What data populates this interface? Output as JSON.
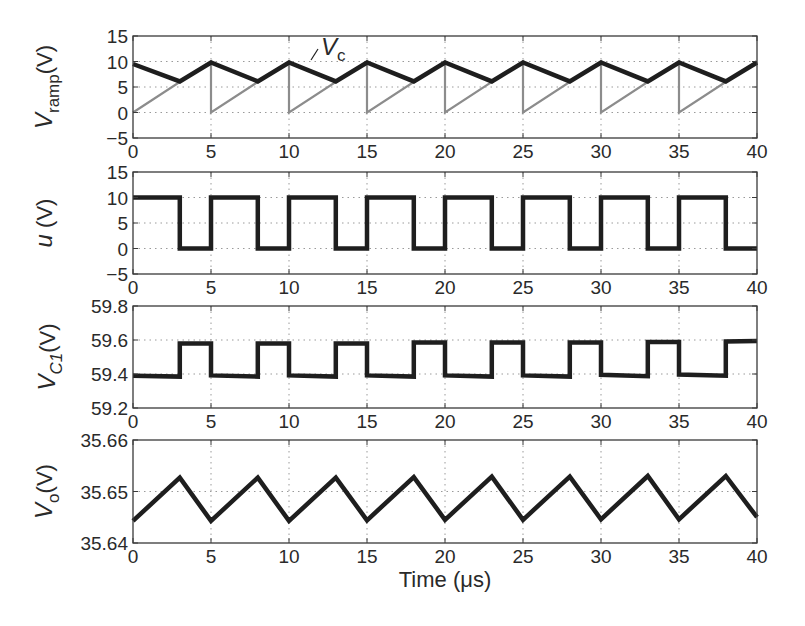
{
  "figure": {
    "xlabel": "Time (μs)",
    "x_ticks": [
      "0",
      "5",
      "10",
      "15",
      "20",
      "25",
      "30",
      "35",
      "40"
    ]
  },
  "colors": {
    "axis": "#3a3a3a",
    "grid": "#9a9a9a",
    "trace_dark": "#1e1e1e",
    "trace_light": "#8c8c8c"
  },
  "chart_data": [
    {
      "type": "line",
      "title": "",
      "xlabel": "",
      "ylabel": "V_ramp(V)",
      "ylabel_main": "V",
      "ylabel_sub": "ramp",
      "ylabel_unit": "(V)",
      "xlim": [
        0,
        40
      ],
      "ylim": [
        -5,
        15
      ],
      "y_ticks": [
        "15",
        "10",
        "5",
        "0",
        "−5"
      ],
      "y_tick_values": [
        15,
        10,
        5,
        0,
        -5
      ],
      "x_ticks": [
        "0",
        "5",
        "10",
        "15",
        "20",
        "25",
        "30",
        "35",
        "40"
      ],
      "grid": true,
      "annotation": {
        "text_main": "V",
        "text_sub": "c",
        "x": 12.2,
        "y": 11.5
      },
      "series": [
        {
          "name": "V_ramp",
          "style": "light",
          "x": [
            0,
            5,
            5,
            10,
            10,
            15,
            15,
            20,
            20,
            25,
            25,
            30,
            30,
            35,
            35,
            40
          ],
          "y": [
            0,
            10,
            0,
            10,
            0,
            10,
            0,
            10,
            0,
            10,
            0,
            10,
            0,
            10,
            0,
            10
          ]
        },
        {
          "name": "V_c",
          "style": "dark",
          "x": [
            0,
            3,
            5,
            8,
            10,
            13,
            15,
            18,
            20,
            23,
            25,
            28,
            30,
            33,
            35,
            38,
            40
          ],
          "y": [
            9.5,
            6.1,
            9.8,
            6.1,
            9.8,
            6.1,
            9.8,
            6.1,
            9.8,
            6.1,
            9.8,
            6.1,
            9.8,
            6.1,
            9.8,
            6.1,
            9.8
          ]
        }
      ]
    },
    {
      "type": "line",
      "title": "",
      "xlabel": "",
      "ylabel": "u (V)",
      "ylabel_main": "u",
      "ylabel_sub": "",
      "ylabel_unit": " (V)",
      "xlim": [
        0,
        40
      ],
      "ylim": [
        -5,
        15
      ],
      "y_ticks": [
        "15",
        "10",
        "5",
        "0",
        "−5"
      ],
      "y_tick_values": [
        15,
        10,
        5,
        0,
        -5
      ],
      "x_ticks": [
        "0",
        "5",
        "10",
        "15",
        "20",
        "25",
        "30",
        "35",
        "40"
      ],
      "grid": true,
      "series": [
        {
          "name": "u",
          "style": "dark",
          "x": [
            0,
            3,
            3,
            5,
            5,
            8,
            8,
            10,
            10,
            13,
            13,
            15,
            15,
            18,
            18,
            20,
            20,
            23,
            23,
            25,
            25,
            28,
            28,
            30,
            30,
            33,
            33,
            35,
            35,
            38,
            38,
            40
          ],
          "y": [
            10,
            10,
            0,
            0,
            10,
            10,
            0,
            0,
            10,
            10,
            0,
            0,
            10,
            10,
            0,
            0,
            10,
            10,
            0,
            0,
            10,
            10,
            0,
            0,
            10,
            10,
            0,
            0,
            10,
            10,
            0,
            0
          ]
        }
      ]
    },
    {
      "type": "line",
      "title": "",
      "xlabel": "",
      "ylabel": "V_C1(V)",
      "ylabel_main": "V",
      "ylabel_sub": "C1",
      "ylabel_unit": "(V)",
      "xlim": [
        0,
        40
      ],
      "ylim": [
        59.2,
        59.8
      ],
      "y_ticks": [
        "59.8",
        "59.6",
        "59.4",
        "59.2"
      ],
      "y_tick_values": [
        59.8,
        59.6,
        59.4,
        59.2
      ],
      "x_ticks": [
        "0",
        "5",
        "10",
        "15",
        "20",
        "25",
        "30",
        "35",
        "40"
      ],
      "grid": true,
      "series": [
        {
          "name": "V_C1",
          "style": "dark",
          "x": [
            0,
            3,
            3,
            5,
            5,
            8,
            8,
            10,
            10,
            13,
            13,
            15,
            15,
            18,
            18,
            20,
            20,
            23,
            23,
            25,
            25,
            28,
            28,
            30,
            30,
            33,
            33,
            35,
            35,
            38,
            38,
            40
          ],
          "y": [
            59.39,
            59.385,
            59.58,
            59.58,
            59.392,
            59.385,
            59.58,
            59.58,
            59.392,
            59.385,
            59.58,
            59.58,
            59.392,
            59.385,
            59.585,
            59.585,
            59.392,
            59.385,
            59.585,
            59.585,
            59.392,
            59.385,
            59.585,
            59.585,
            59.395,
            59.387,
            59.588,
            59.588,
            59.397,
            59.39,
            59.592,
            59.594
          ]
        }
      ]
    },
    {
      "type": "line",
      "title": "",
      "xlabel": "Time (μs)",
      "ylabel": "V_o(V)",
      "ylabel_main": "V",
      "ylabel_sub": "o",
      "ylabel_unit": "(V)",
      "xlim": [
        0,
        40
      ],
      "ylim": [
        35.64,
        35.66
      ],
      "y_ticks": [
        "35.66",
        "35.65",
        "35.64"
      ],
      "y_tick_values": [
        35.66,
        35.65,
        35.64
      ],
      "x_ticks": [
        "0",
        "5",
        "10",
        "15",
        "20",
        "25",
        "30",
        "35",
        "40"
      ],
      "grid": true,
      "series": [
        {
          "name": "V_o",
          "style": "dark",
          "x": [
            0,
            3,
            5,
            8,
            10,
            13,
            15,
            18,
            20,
            23,
            25,
            28,
            30,
            33,
            35,
            38,
            40
          ],
          "y": [
            35.6443,
            35.6527,
            35.6443,
            35.6527,
            35.6443,
            35.6527,
            35.6444,
            35.6528,
            35.6445,
            35.6529,
            35.6445,
            35.6529,
            35.6446,
            35.653,
            35.6446,
            35.653,
            35.645
          ]
        }
      ]
    }
  ]
}
